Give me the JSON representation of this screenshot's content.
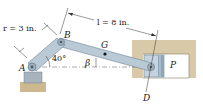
{
  "diagram": {
    "type": "slider-crank mechanism",
    "labels": {
      "crank_length": "r = 3 in.",
      "rod_length": "l = 8 in.",
      "point_a": "A",
      "point_b": "B",
      "point_g": "G",
      "point_d": "D",
      "piston": "P",
      "crank_angle": "40°",
      "rod_angle": "β"
    },
    "values": {
      "r_in": 3,
      "l_in": 8,
      "crank_angle_deg": 40
    },
    "colors": {
      "link_fill": "#b9c9d6",
      "link_stroke": "#6f8596",
      "housing": "#d8c9a8",
      "ground": "#cdb98f",
      "piston": "#c4d3df",
      "line": "#333333"
    }
  }
}
